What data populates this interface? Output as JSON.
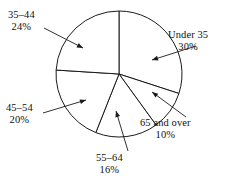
{
  "chart_data": {
    "type": "pie",
    "title": "",
    "subtitle": "",
    "xlabel": "",
    "ylabel": "",
    "legend_position": "none",
    "grid": false,
    "units": "percent",
    "total": 100,
    "start_angle_deg": 0,
    "direction": "clockwise",
    "categories": [
      "Under 35",
      "65 and over",
      "55–64",
      "45–54",
      "35–44"
    ],
    "values": [
      30,
      10,
      16,
      20,
      24
    ],
    "slices": [
      {
        "label": "Under 35",
        "percent_text": "30%",
        "value": 30,
        "start_angle_deg": 0,
        "end_angle_deg": 108,
        "label_position": "right"
      },
      {
        "label": "65 and over",
        "percent_text": "10%",
        "value": 10,
        "start_angle_deg": 108,
        "end_angle_deg": 144,
        "label_position": "bottom-right"
      },
      {
        "label": "55–64",
        "percent_text": "16%",
        "value": 16,
        "start_angle_deg": 144,
        "end_angle_deg": 201.6,
        "label_position": "bottom"
      },
      {
        "label": "45–54",
        "percent_text": "20%",
        "value": 20,
        "start_angle_deg": 201.6,
        "end_angle_deg": 273.6,
        "label_position": "left"
      },
      {
        "label": "35–44",
        "percent_text": "24%",
        "value": 24,
        "start_angle_deg": 273.6,
        "end_angle_deg": 360,
        "label_position": "top-left"
      }
    ],
    "colors": {
      "slice_fill": "#ffffff",
      "slice_stroke": "#1a1a1a",
      "leader_line": "#1a1a1a",
      "text": "#111111",
      "background": "#ffffff"
    },
    "geometry": {
      "center_x": 119,
      "center_y": 74,
      "radius": 63
    },
    "leaders": [
      {
        "for": "Under 35",
        "x1": 196,
        "y1": 46,
        "x2": 152,
        "y2": 60
      },
      {
        "for": "65 and over",
        "x1": 186,
        "y1": 117,
        "x2": 152,
        "y2": 92
      },
      {
        "for": "55–64",
        "x1": 128,
        "y1": 151,
        "x2": 116,
        "y2": 111
      },
      {
        "for": "45–54",
        "x1": 43,
        "y1": 113,
        "x2": 86,
        "y2": 100
      },
      {
        "for": "35–44",
        "x1": 44,
        "y1": 28,
        "x2": 83,
        "y2": 48
      }
    ]
  }
}
